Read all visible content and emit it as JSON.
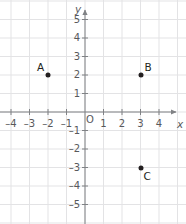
{
  "figure": {
    "type": "coordinate-plane",
    "width": 186,
    "height": 224,
    "background_color": "#ffffff",
    "grid_color": "#e3e3e5",
    "axis_color": "#808285",
    "label_color": "#58595b",
    "point_color": "#231f20",
    "origin_label": "O",
    "x_axis_name": "x",
    "y_axis_name": "y",
    "grid_spacing_px": 18.5,
    "origin_px": {
      "x": 85,
      "y": 112
    }
  },
  "chart_data": {
    "type": "scatter",
    "title": "",
    "xlabel": "x",
    "ylabel": "y",
    "xlim": [
      -4.6,
      5.4
    ],
    "ylim": [
      -6.0,
      6.0
    ],
    "grid": true,
    "legend": "none",
    "x_ticks": [
      -4,
      -3,
      -2,
      -1,
      1,
      2,
      3,
      4
    ],
    "x_tick_labels": [
      "–4",
      "–3",
      "–2",
      "–1",
      "1",
      "2",
      "3",
      "4"
    ],
    "y_ticks": [
      5,
      4,
      3,
      2,
      1,
      -1,
      -2,
      -3,
      -4,
      -5
    ],
    "y_tick_labels": [
      "5",
      "4",
      "3",
      "2",
      "1",
      "–1",
      "–2",
      "–3",
      "–4",
      "–5"
    ],
    "points": [
      {
        "name": "A",
        "x": -2,
        "y": 2,
        "label_dx": -11,
        "label_dy": -13
      },
      {
        "name": "B",
        "x": 3,
        "y": 2,
        "label_dx": 4,
        "label_dy": -13
      },
      {
        "name": "C",
        "x": 3,
        "y": -3,
        "label_dx": 3,
        "label_dy": 3
      }
    ]
  }
}
